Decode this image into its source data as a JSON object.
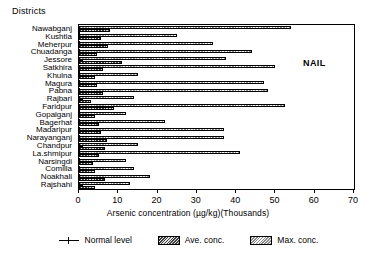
{
  "chart_data": {
    "type": "bar",
    "orientation": "horizontal",
    "title": "",
    "ylabel": "Districts",
    "xlabel": "Arsenic concentration (µg/kg)(Thousands)",
    "xlim": [
      0,
      70
    ],
    "xticks": [
      0,
      10,
      20,
      30,
      40,
      50,
      60,
      70
    ],
    "xtick_labels": [
      "0",
      "10",
      "20",
      "30",
      "40",
      "50",
      "60",
      "70"
    ],
    "grid": false,
    "legend_position": "bottom",
    "annotation": "NAIL",
    "categories": [
      "Nawabganj",
      "Kushtia",
      "Meherpur",
      "Chuadanga",
      "Jessore",
      "Satkhira",
      "Khulna",
      "Magura",
      "Pabna",
      "Rajbari",
      "Faridpur",
      "Gopalganj",
      "Bagerhat",
      "Madaripur",
      "Narayanganj",
      "Chandpur",
      "La.shmipur",
      "Narsingdi",
      "Comilla",
      "Noakhali",
      "Rajshahi"
    ],
    "series": [
      {
        "name": "Ave. conc.",
        "values": [
          8.0,
          5.5,
          7.5,
          4.5,
          11.0,
          6.0,
          4.0,
          4.5,
          6.0,
          3.0,
          9.0,
          4.0,
          5.0,
          5.5,
          7.0,
          6.5,
          5.0,
          3.5,
          4.0,
          6.5,
          4.0
        ]
      },
      {
        "name": "Max. conc.",
        "values": [
          54.0,
          25.0,
          34.0,
          44.0,
          37.5,
          50.0,
          15.0,
          47.0,
          48.0,
          14.0,
          52.5,
          12.0,
          22.0,
          37.0,
          37.0,
          15.0,
          41.0,
          12.0,
          14.0,
          18.0,
          13.0
        ]
      }
    ],
    "legend": [
      {
        "label": "Normal level",
        "kind": "line-marker"
      },
      {
        "label": "Ave. conc.",
        "kind": "hatch-dark"
      },
      {
        "label": "Max. conc.",
        "kind": "hatch-light"
      }
    ]
  }
}
